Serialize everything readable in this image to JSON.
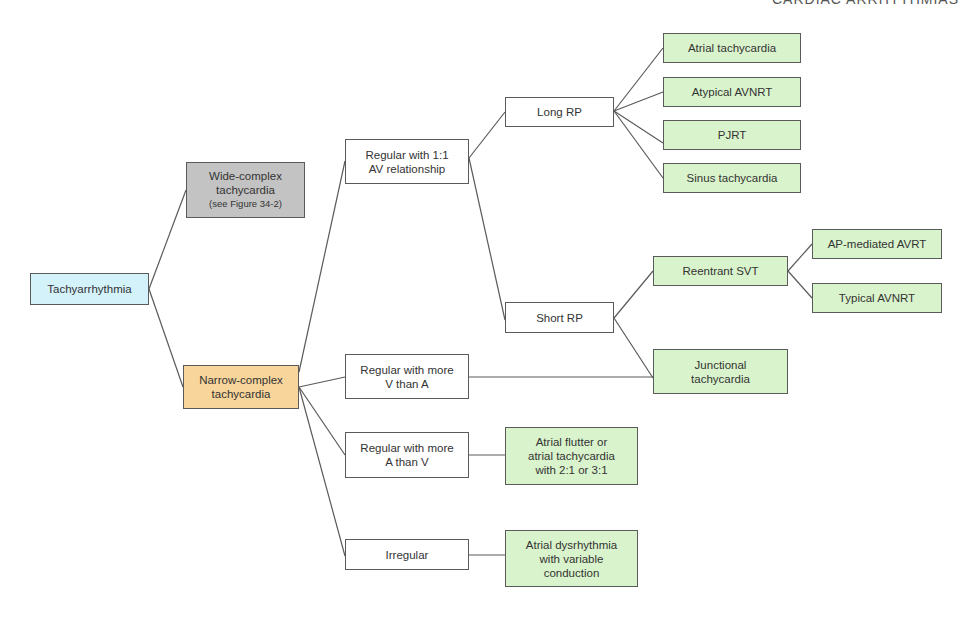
{
  "header": {
    "title": "CARDIAC ARRHYTHMIAS"
  },
  "colors": {
    "root": "#d4f2fa",
    "wide": "#c3c3c3",
    "narrow": "#f8d59b",
    "mid": "#ffffff",
    "leaf": "#d9f3cc",
    "line": "#5a5a5a"
  },
  "nodes": {
    "tachyarrhythmia": {
      "label": "Tachyarrhythmia"
    },
    "wide": {
      "label": "Wide-complex\ntachycardia",
      "sub": "(see Figure 34-2)"
    },
    "narrow": {
      "label": "Narrow-complex\ntachycardia"
    },
    "regular_1_1": {
      "label": "Regular with 1:1\nAV relationship"
    },
    "regular_v_gt_a": {
      "label": "Regular with more\nV than A"
    },
    "regular_a_gt_v": {
      "label": "Regular with more\nA than V"
    },
    "irregular": {
      "label": "Irregular"
    },
    "long_rp": {
      "label": "Long RP"
    },
    "short_rp": {
      "label": "Short RP"
    },
    "atrial_tachycardia": {
      "label": "Atrial tachycardia"
    },
    "atypical_avnrt": {
      "label": "Atypical AVNRT"
    },
    "pjrt": {
      "label": "PJRT"
    },
    "sinus_tachycardia": {
      "label": "Sinus tachycardia"
    },
    "reentrant_svt": {
      "label": "Reentrant SVT"
    },
    "ap_mediated_avrt": {
      "label": "AP-mediated AVRT"
    },
    "typical_avnrt": {
      "label": "Typical AVNRT"
    },
    "junctional_tachycardia": {
      "label": "Junctional\ntachycardia"
    },
    "atrial_flutter": {
      "label": "Atrial flutter or\natrial tachycardia\nwith 2:1 or 3:1"
    },
    "atrial_dysrhythmia": {
      "label": "Atrial dysrhythmia\nwith variable\nconduction"
    }
  }
}
